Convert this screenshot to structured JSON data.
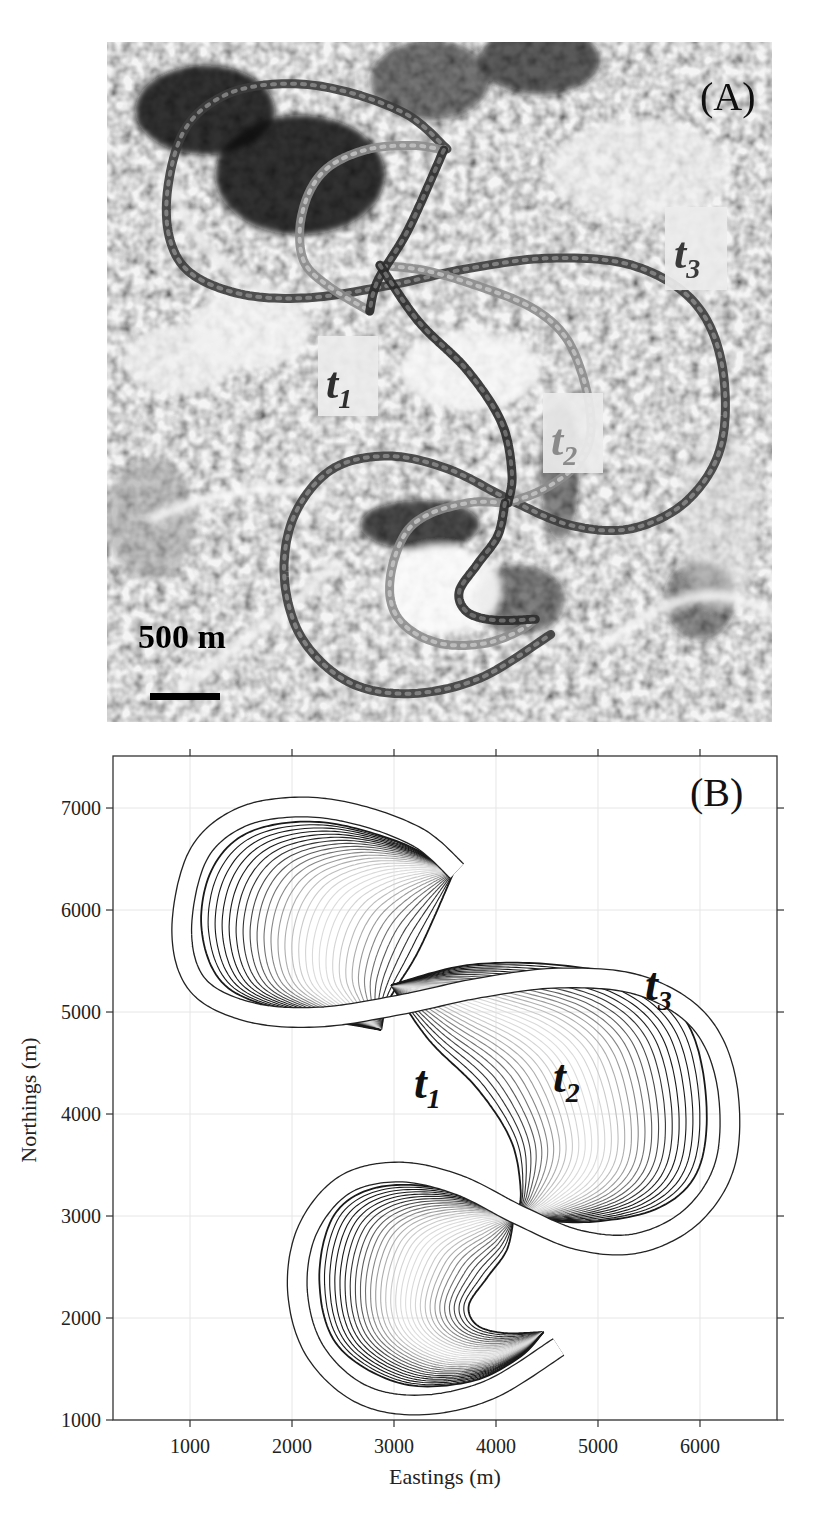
{
  "figure": {
    "panel_a": {
      "label": "(A)",
      "scale_bar_text": "500 m",
      "time_labels": [
        {
          "base": "t",
          "sub": "1",
          "color": "#2e2e2e"
        },
        {
          "base": "t",
          "sub": "2",
          "color": "#8a8a8a"
        },
        {
          "base": "t",
          "sub": "3",
          "color": "#3a3a3a"
        }
      ]
    },
    "panel_b": {
      "label": "(B)",
      "xlabel": "Eastings (m)",
      "ylabel": "Northings (m)",
      "time_labels": [
        {
          "base": "t",
          "sub": "1"
        },
        {
          "base": "t",
          "sub": "2"
        },
        {
          "base": "t",
          "sub": "3"
        }
      ]
    }
  },
  "chart_data": {
    "type": "line",
    "title": "(B)",
    "xlabel": "Eastings (m)",
    "ylabel": "Northings (m)",
    "xlim": [
      245,
      6755
    ],
    "ylim": [
      1000,
      7510
    ],
    "xticks": [
      1000,
      2000,
      3000,
      4000,
      5000,
      6000
    ],
    "yticks": [
      1000,
      2000,
      3000,
      4000,
      5000,
      6000,
      7000
    ],
    "grid": true,
    "legend": null,
    "annotations": [
      {
        "text": "t1",
        "x": 3340,
        "y": 4250
      },
      {
        "text": "t2",
        "x": 4640,
        "y": 4250
      },
      {
        "text": "t3",
        "x": 5600,
        "y": 5050
      }
    ],
    "series": [
      {
        "name": "t3 channel (outer band)",
        "points": [
          [
            3617,
            6382
          ],
          [
            3245,
            6706
          ],
          [
            2659,
            6931
          ],
          [
            2072,
            7010
          ],
          [
            1486,
            6902
          ],
          [
            1075,
            6529
          ],
          [
            919,
            5804
          ],
          [
            1075,
            5265
          ],
          [
            1584,
            5000
          ],
          [
            2268,
            4951
          ],
          [
            3050,
            5069
          ],
          [
            3832,
            5235
          ],
          [
            4614,
            5333
          ],
          [
            5396,
            5265
          ],
          [
            5982,
            4922
          ],
          [
            6256,
            4333
          ],
          [
            6256,
            3549
          ],
          [
            5934,
            3010
          ],
          [
            5396,
            2735
          ],
          [
            4809,
            2765
          ],
          [
            4223,
            3010
          ],
          [
            3636,
            3304
          ],
          [
            3050,
            3431
          ],
          [
            2512,
            3304
          ],
          [
            2151,
            2863
          ],
          [
            2053,
            2275
          ],
          [
            2219,
            1686
          ],
          [
            2659,
            1265
          ],
          [
            3245,
            1147
          ],
          [
            3930,
            1294
          ],
          [
            4614,
            1716
          ]
        ]
      },
      {
        "name": "upper lobe - t1 inner boundary",
        "points": [
          [
            3587,
            6373
          ],
          [
            3245,
            5608
          ],
          [
            2952,
            5118
          ],
          [
            2874,
            4824
          ]
        ]
      },
      {
        "name": "upper lobe - outer boundary",
        "points": [
          [
            3587,
            6373
          ],
          [
            3050,
            6667
          ],
          [
            2268,
            6863
          ],
          [
            1584,
            6765
          ],
          [
            1212,
            6392
          ],
          [
            1114,
            5804
          ],
          [
            1339,
            5265
          ],
          [
            1975,
            5000
          ],
          [
            2874,
            4824
          ]
        ]
      },
      {
        "name": "middle lobe - t1 inner boundary",
        "points": [
          [
            2972,
            5265
          ],
          [
            3343,
            4725
          ],
          [
            3812,
            4255
          ],
          [
            4145,
            3745
          ],
          [
            4242,
            3255
          ],
          [
            4203,
            2980
          ]
        ]
      },
      {
        "name": "middle lobe - outer boundary",
        "points": [
          [
            2972,
            5265
          ],
          [
            3734,
            5461
          ],
          [
            4614,
            5461
          ],
          [
            5396,
            5294
          ],
          [
            5885,
            4873
          ],
          [
            6061,
            4137
          ],
          [
            5982,
            3451
          ],
          [
            5591,
            3078
          ],
          [
            4907,
            2941
          ],
          [
            4203,
            2980
          ]
        ]
      },
      {
        "name": "lower lobe - t1 inner boundary",
        "points": [
          [
            4174,
            2980
          ],
          [
            4106,
            2667
          ],
          [
            3910,
            2392
          ],
          [
            3734,
            2127
          ],
          [
            3812,
            1931
          ],
          [
            4076,
            1853
          ],
          [
            4467,
            1863
          ]
        ]
      },
      {
        "name": "lower lobe - outer boundary",
        "points": [
          [
            4174,
            2980
          ],
          [
            3539,
            3255
          ],
          [
            2854,
            3284
          ],
          [
            2414,
            3010
          ],
          [
            2268,
            2373
          ],
          [
            2444,
            1735
          ],
          [
            3050,
            1363
          ],
          [
            3734,
            1373
          ],
          [
            4223,
            1608
          ],
          [
            4467,
            1863
          ]
        ]
      }
    ],
    "nested_curves_per_lobe": 30
  }
}
